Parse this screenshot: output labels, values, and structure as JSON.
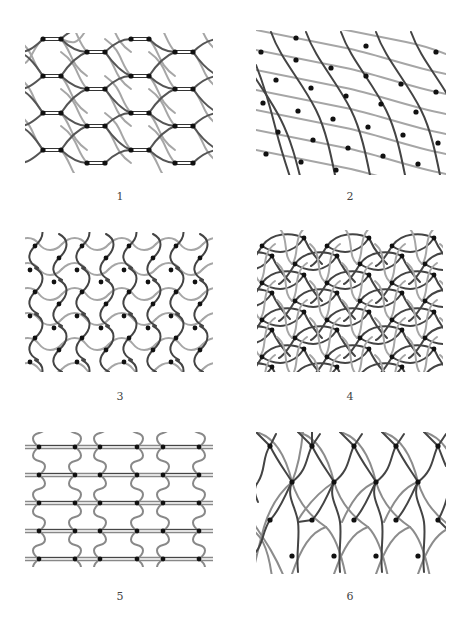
{
  "figure": {
    "panels": [
      {
        "id": 1,
        "label": "1",
        "description": "staggered rows of horizontal double-line rungs joined by dark and light lens curves"
      },
      {
        "id": 2,
        "label": "2",
        "description": "dark steep wavy diagonals crossing light shallow wavy diagonals"
      },
      {
        "id": 3,
        "label": "3",
        "description": "dense zigzag S-curve lattice"
      },
      {
        "id": 4,
        "label": "4",
        "description": "interwoven lens / flower lattice"
      },
      {
        "id": 5,
        "label": "5",
        "description": "horizontal double lines with wavy vertical connectors"
      },
      {
        "id": 6,
        "label": "6",
        "description": "dark wavy verticals crossing light arcs"
      }
    ],
    "colors": {
      "dark_line": "#444444",
      "light_line": "#a6a6a6",
      "node": "#111111",
      "background": "#ffffff"
    }
  }
}
